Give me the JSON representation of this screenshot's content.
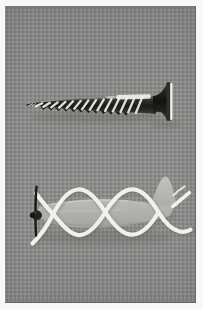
{
  "figure": {
    "kind": "halftone-photograph-plate",
    "objects": [
      {
        "id": "screw",
        "label": "wood screw lying horizontally, tip pointing left, flat head at right"
      },
      {
        "id": "airplane",
        "label": "toy airplane facing left with white helical ribbon tracing the propeller screw path"
      }
    ]
  },
  "colors": {
    "page_bg": "#f8f8f6",
    "photo_bg": "#8b8b89",
    "screw_dark": "#23231f",
    "screw_highlight": "#f0f0ec",
    "head_face": "#2e2e2a",
    "head_rim": "#f6f6f2",
    "fuselage_top": "#cdcdc8",
    "fuselage_mid": "#bcbcb7",
    "fuselage_bottom": "#a5a5a0",
    "ribbon": "#f0f0ec",
    "ribbon_shadow": "#55554f",
    "propeller": "#1b1b19",
    "shadow": "#1a1a18"
  }
}
